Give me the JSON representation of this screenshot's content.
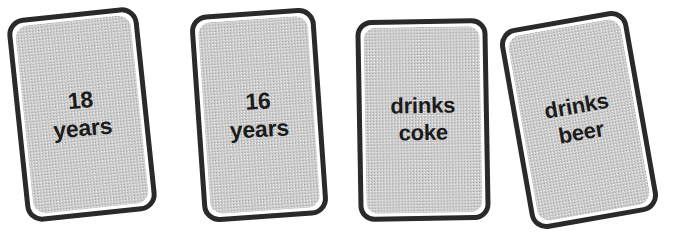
{
  "scene": {
    "width": 682,
    "height": 245,
    "background_color": "#ffffff",
    "description": "Four hand-drawn style rounded rectangle cards in a row, each tilted, with bold two-line labels"
  },
  "style": {
    "card_fill_color": "#cbcbcb",
    "card_border_color": "#2a2a2a",
    "card_gap_color": "#ffffff",
    "text_color": "#1b1b1b"
  },
  "cards": [
    {
      "id": "card-18-years",
      "line1": "18",
      "line2": "years",
      "rotation_deg": -6,
      "left": 16,
      "top": 12,
      "width": 132,
      "height": 205,
      "border_width": 5,
      "corner_radius": 17,
      "font_size": 23,
      "text_rotation_deg": 1
    },
    {
      "id": "card-16-years",
      "line1": "16",
      "line2": "years",
      "rotation_deg": -4,
      "left": 196,
      "top": 11,
      "width": 126,
      "height": 208,
      "border_width": 5,
      "corner_radius": 17,
      "font_size": 23,
      "text_rotation_deg": 1
    },
    {
      "id": "card-drinks-coke",
      "line1": "drinks",
      "line2": "coke",
      "rotation_deg": -1,
      "left": 357,
      "top": 19,
      "width": 132,
      "height": 202,
      "border_width": 5,
      "corner_radius": 16,
      "font_size": 22,
      "text_rotation_deg": 0
    },
    {
      "id": "card-drinks-beer",
      "line1": "drinks",
      "line2": "beer",
      "rotation_deg": -10,
      "left": 514,
      "top": 18,
      "width": 130,
      "height": 204,
      "border_width": 5,
      "corner_radius": 17,
      "font_size": 22,
      "text_rotation_deg": 0
    }
  ]
}
